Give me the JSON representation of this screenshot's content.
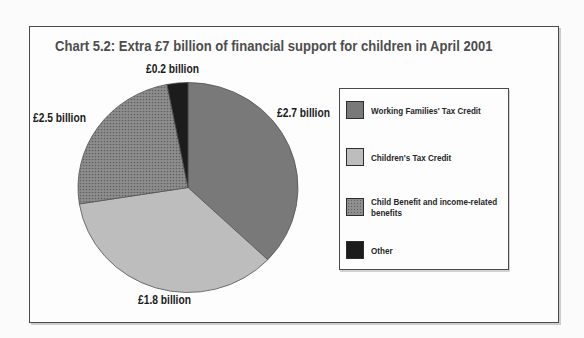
{
  "frame": {
    "title": "Chart 5.2: Extra £7 billion of financial support for children in April 2001"
  },
  "chart_data": {
    "type": "pie",
    "chart_number": "Chart 5.2",
    "title": "Extra £7 billion of financial support for children in April 2001",
    "total": "£7 billion",
    "unit": "£ billion",
    "legend_position": "right",
    "slices": [
      {
        "label": "Working Families' Tax Credit",
        "value": 2.7,
        "value_label": "£2.7 billion",
        "color": "#797979",
        "pattern": "solid",
        "start_angle": 0,
        "end_angle": 133.5
      },
      {
        "label": "Children's Tax Credit",
        "value": 1.8,
        "value_label": "£1.8 billion",
        "color": "#bdbdbd",
        "pattern": "solid",
        "start_angle": 133.5,
        "end_angle": 261
      },
      {
        "label": "Child Benefit and income-related benefits",
        "value": 2.5,
        "value_label": "£2.5 billion",
        "color": "#8f8f8f",
        "dot_color": "#5f5f5f",
        "pattern": "halftone-dots",
        "start_angle": 261,
        "end_angle": 349
      },
      {
        "label": "Other",
        "value": 0.2,
        "value_label": "£0.2 billion",
        "color": "#1c1c1c",
        "pattern": "solid",
        "start_angle": 349,
        "end_angle": 360
      }
    ]
  },
  "legend": {
    "items": [
      {
        "slice": 0,
        "lines": [
          "Working Families' Tax Credit",
          ""
        ]
      },
      {
        "slice": 1,
        "lines": [
          "Children's Tax Credit",
          ""
        ]
      },
      {
        "slice": 2,
        "lines": [
          "Child Benefit and income-related",
          "benefits"
        ]
      },
      {
        "slice": 3,
        "lines": [
          "Other",
          ""
        ]
      }
    ]
  }
}
